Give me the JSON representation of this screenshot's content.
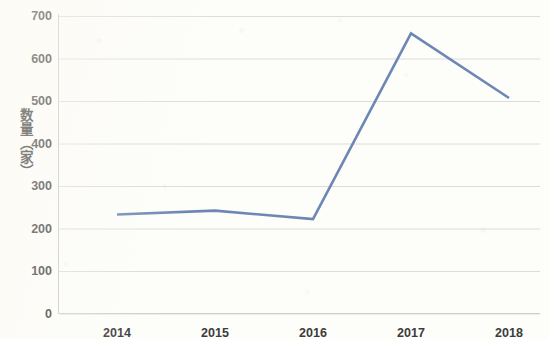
{
  "chart_data": {
    "type": "line",
    "title": "",
    "xlabel": "",
    "ylabel": "数量（家）",
    "categories": [
      "2014",
      "2015",
      "2016",
      "2017",
      "2018"
    ],
    "values": [
      233,
      242,
      222,
      659,
      507
    ],
    "series": [
      {
        "name": "数量（家）",
        "values": [
          233,
          242,
          222,
          659,
          507
        ],
        "color": "#6d87b5"
      }
    ],
    "ylim": [
      0,
      700
    ],
    "y_ticks": [
      0,
      100,
      200,
      300,
      400,
      500,
      600,
      700
    ],
    "y_tick_labels": [
      "0",
      "100",
      "200",
      "300",
      "400",
      "500",
      "600",
      "700"
    ],
    "x_tick_labels": [
      "2014",
      "2015",
      "2016",
      "2017",
      "2018"
    ],
    "grid": "horizontal",
    "legend": "none",
    "markers": false,
    "line_width": 2.6
  },
  "colors": {
    "line": "#6d87b5",
    "grid": "#dcdcdc",
    "axis": "#c9c9c9",
    "text": "#3b3b3b",
    "background": "#fdfdfa"
  }
}
